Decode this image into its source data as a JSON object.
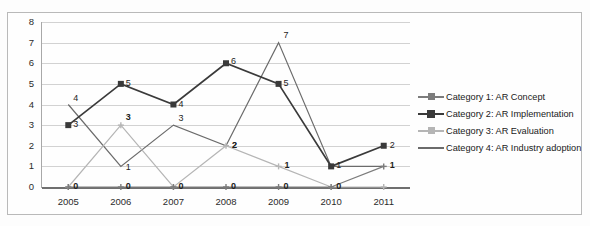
{
  "chart_data": {
    "type": "line",
    "title": "",
    "xlabel": "",
    "ylabel": "",
    "categories": [
      "2005",
      "2006",
      "2007",
      "2008",
      "2009",
      "2010",
      "2011"
    ],
    "ylim": [
      0,
      8
    ],
    "yticks": [
      "0",
      "1",
      "2",
      "3",
      "4",
      "5",
      "6",
      "7",
      "8"
    ],
    "grid": true,
    "legend_position": "right",
    "series": [
      {
        "name": "Category 1: AR Concept",
        "marker": "plus",
        "color": "#7c7c7c",
        "values": [
          0,
          0,
          0,
          0,
          0,
          0,
          1
        ],
        "labels": [
          "0",
          "0",
          "0",
          "0",
          "0",
          "0",
          "1"
        ]
      },
      {
        "name": "Category 2: AR Implementation",
        "marker": "square",
        "color": "#3a3a3a",
        "values": [
          3,
          5,
          4,
          6,
          5,
          1,
          2
        ],
        "labels": [
          "3",
          "5",
          "4",
          "6",
          "5",
          "1",
          "2"
        ]
      },
      {
        "name": "Category 3: AR Evaluation",
        "marker": "cross",
        "color": "#b5b5b5",
        "values": [
          0,
          3,
          0,
          2,
          1,
          0,
          0
        ],
        "labels": [
          "0",
          "3",
          "0",
          "2",
          "1",
          "0",
          "0"
        ]
      },
      {
        "name": "Category 4: AR Industry adoption",
        "marker": "none",
        "color": "#6b6b6b",
        "values": [
          4,
          1,
          3,
          2,
          7,
          1,
          1
        ],
        "labels": [
          "4",
          "1",
          "3",
          "2",
          "7",
          "1",
          "1"
        ]
      }
    ]
  }
}
